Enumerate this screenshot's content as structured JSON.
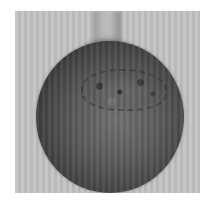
{
  "image": {
    "description": "Grayscale micrograph of a dark spherical droplet hanging from a thin neck at the top, with a textured crust region in the upper half",
    "colors": {
      "background": "#c3c3c3",
      "margin": "#ffffff",
      "droplet_core": "#6f6f6f",
      "droplet_edge": "#1a1a1a"
    }
  }
}
